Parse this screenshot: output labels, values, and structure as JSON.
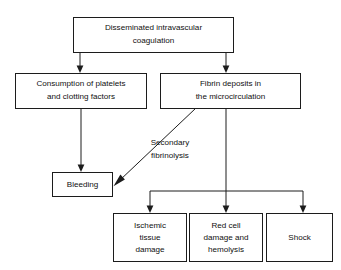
{
  "diagram": {
    "background_color": "#ffffff",
    "line_color": "#1c1c1c",
    "text_color": "#101010",
    "nodes": {
      "dic": {
        "line1": "Disseminated intravascular",
        "line2": "coagulation"
      },
      "consumption": {
        "line1": "Consumption of platelets",
        "line2": "and clotting factors"
      },
      "fibrin": {
        "line1": "Fibrin deposits in",
        "line2": "the microcirculation"
      },
      "bleeding": {
        "line1": "Bleeding"
      },
      "ischemic": {
        "line1": "Ischemic",
        "line2": "tissue",
        "line3": "damage"
      },
      "redcell": {
        "line1": "Red cell",
        "line2": "damage and",
        "line3": "hemolysis"
      },
      "shock": {
        "line1": "Shock"
      }
    },
    "edge_labels": {
      "secondary_fibrinolysis": {
        "line1": "Secondary",
        "line2": "fibrinolysis"
      }
    }
  }
}
